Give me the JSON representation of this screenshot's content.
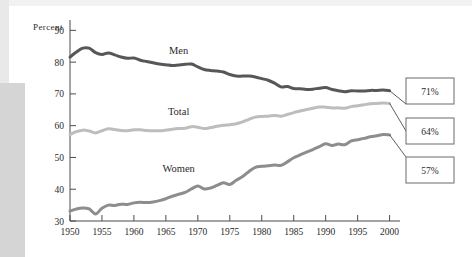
{
  "chart_data": {
    "type": "line",
    "title": "",
    "xlabel": "",
    "ylabel": "Percent",
    "ylabel_display": "Percent",
    "xlim": [
      1950,
      2001
    ],
    "ylim": [
      30,
      92
    ],
    "grid": false,
    "legend": "inline-labels",
    "y_ticks": [
      "30",
      "40",
      "50",
      "60",
      "70",
      "80",
      "90"
    ],
    "y_tick_values": [
      30,
      40,
      50,
      60,
      70,
      80,
      90
    ],
    "x_ticks": [
      "1950",
      "1955",
      "1960",
      "1965",
      "1970",
      "1975",
      "1980",
      "1985",
      "1990",
      "1995",
      "2000"
    ],
    "x_tick_values": [
      1950,
      1955,
      1960,
      1965,
      1970,
      1975,
      1980,
      1985,
      1990,
      1995,
      2000
    ],
    "x": [
      1950,
      1951,
      1952,
      1953,
      1954,
      1955,
      1956,
      1957,
      1958,
      1959,
      1960,
      1961,
      1962,
      1963,
      1964,
      1965,
      1966,
      1967,
      1968,
      1969,
      1970,
      1971,
      1972,
      1973,
      1974,
      1975,
      1976,
      1977,
      1978,
      1979,
      1980,
      1981,
      1982,
      1983,
      1984,
      1985,
      1986,
      1987,
      1988,
      1989,
      1990,
      1991,
      1992,
      1993,
      1994,
      1995,
      1996,
      1997,
      1998,
      1999,
      2000
    ],
    "series": [
      {
        "name": "Men",
        "color": "#575757",
        "label": "Men",
        "end_value": 71,
        "end_label": "71%",
        "values": [
          81.6,
          83.2,
          84.4,
          84.4,
          83.0,
          82.4,
          82.9,
          82.3,
          81.6,
          81.2,
          81.3,
          80.6,
          80.2,
          79.8,
          79.4,
          79.2,
          78.9,
          79.1,
          79.3,
          79.4,
          78.5,
          77.7,
          77.4,
          77.2,
          76.9,
          76.1,
          75.6,
          75.6,
          75.6,
          75.3,
          74.8,
          74.3,
          73.4,
          72.2,
          72.3,
          71.7,
          71.6,
          71.4,
          71.5,
          71.8,
          72.0,
          71.4,
          71.0,
          70.7,
          71.0,
          70.9,
          70.9,
          71.1,
          71.1,
          71.2,
          71.0
        ]
      },
      {
        "name": "Total",
        "color": "#bdbdbd",
        "label": "Total",
        "end_value": 64,
        "end_label": "64%",
        "values": [
          57.2,
          58.1,
          58.6,
          58.3,
          57.7,
          58.4,
          59.0,
          58.8,
          58.5,
          58.4,
          58.7,
          58.7,
          58.5,
          58.4,
          58.4,
          58.6,
          58.9,
          59.1,
          59.2,
          59.7,
          59.5,
          59.1,
          59.4,
          59.8,
          60.1,
          60.3,
          60.6,
          61.2,
          62.0,
          62.7,
          62.9,
          63.0,
          63.2,
          63.0,
          63.5,
          64.1,
          64.6,
          65.1,
          65.5,
          65.9,
          65.8,
          65.6,
          65.6,
          65.5,
          66.0,
          66.3,
          66.6,
          66.9,
          67.0,
          67.1,
          67.0
        ]
      },
      {
        "name": "Women",
        "color": "#8d8d8d",
        "label": "Women",
        "end_value": 57,
        "end_label": "57%",
        "values": [
          33.1,
          33.8,
          34.1,
          33.8,
          32.2,
          34.0,
          35.0,
          34.9,
          35.3,
          35.2,
          35.7,
          35.9,
          35.8,
          36.0,
          36.4,
          37.0,
          37.8,
          38.4,
          39.0,
          40.1,
          41.0,
          40.1,
          40.4,
          41.2,
          42.0,
          41.5,
          42.8,
          44.0,
          45.6,
          46.9,
          47.2,
          47.4,
          47.6,
          47.5,
          48.6,
          49.9,
          50.8,
          51.7,
          52.5,
          53.4,
          54.3,
          53.8,
          54.2,
          54.0,
          55.2,
          55.6,
          56.0,
          56.5,
          56.8,
          57.2,
          57.1
        ]
      }
    ],
    "callouts": [
      {
        "name": "men-callout",
        "value": "71%"
      },
      {
        "name": "total-callout",
        "value": "64%"
      },
      {
        "name": "women-callout",
        "value": "57%"
      }
    ]
  }
}
